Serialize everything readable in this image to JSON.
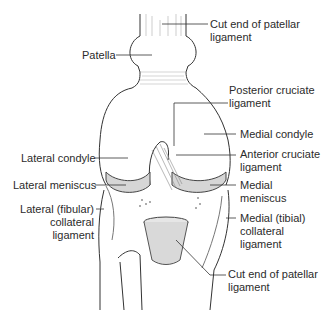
{
  "diagram": {
    "labels": [
      {
        "id": "cut-end-patellar-top",
        "lines": [
          "Cut end of patellar",
          "ligament"
        ]
      },
      {
        "id": "patella",
        "lines": [
          "Patella"
        ]
      },
      {
        "id": "posterior-cruciate",
        "lines": [
          "Posterior cruciate",
          "ligament"
        ]
      },
      {
        "id": "medial-condyle",
        "lines": [
          "Medial condyle"
        ]
      },
      {
        "id": "lateral-condyle",
        "lines": [
          "Lateral condyle"
        ]
      },
      {
        "id": "anterior-cruciate",
        "lines": [
          "Anterior cruciate",
          "ligament"
        ]
      },
      {
        "id": "lateral-meniscus",
        "lines": [
          "Lateral meniscus"
        ]
      },
      {
        "id": "medial-meniscus",
        "lines": [
          "Medial",
          "meniscus"
        ]
      },
      {
        "id": "lateral-collateral",
        "lines": [
          "Lateral (fibular)",
          "collateral",
          "ligament"
        ]
      },
      {
        "id": "medial-collateral",
        "lines": [
          "Medial (tibial)",
          "collateral",
          "ligament"
        ]
      },
      {
        "id": "cut-end-patellar-bottom",
        "lines": [
          "Cut end of patellar",
          "ligament"
        ]
      }
    ]
  }
}
